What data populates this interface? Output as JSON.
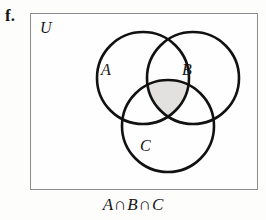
{
  "figure": {
    "part_label": "f.",
    "universe_label": "U",
    "caption": "A ∩ B ∩ C",
    "caption_parts": {
      "set_a": "A",
      "op1": "∩",
      "set_b": "B",
      "op2": "∩",
      "set_c": "C"
    },
    "colors": {
      "stroke": "#111111",
      "shaded_region": "#e2e1df",
      "box_border": "#8d8d8d",
      "background": "#fdfdfc",
      "text": "#161616"
    },
    "circles": [
      {
        "id": "A",
        "label": "A",
        "cx": 113,
        "cy": 65,
        "r": 46,
        "label_x": 71,
        "label_y": 62
      },
      {
        "id": "B",
        "label": "B",
        "cx": 163,
        "cy": 65,
        "r": 46,
        "label_x": 152,
        "label_y": 62
      },
      {
        "id": "C",
        "label": "C",
        "cx": 138,
        "cy": 113,
        "r": 46,
        "label_x": 110,
        "label_y": 138
      }
    ],
    "shaded_description": "triple intersection of A, B and C"
  }
}
